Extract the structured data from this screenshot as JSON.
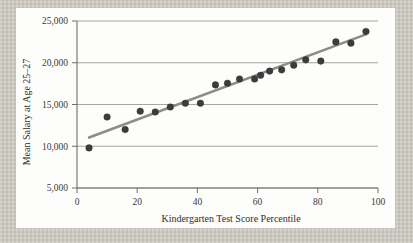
{
  "figure": {
    "background_color": "#cbc7be",
    "card_color": "#fdfdfb",
    "marker_color": "#3c3c3c",
    "trend_color": "#8c8c88",
    "grid_color": "#8e8e8a"
  },
  "chart_data": {
    "type": "scatter",
    "title": "",
    "xlabel": "Kindergarten Test Score Percentile",
    "ylabel": "Mean Salary at Age 25–27",
    "xlim": [
      0,
      100
    ],
    "ylim": [
      5000,
      25000
    ],
    "xticks": [
      0,
      20,
      40,
      60,
      80,
      100
    ],
    "xtick_labels": [
      "0",
      "20",
      "40",
      "60",
      "80",
      "100"
    ],
    "yticks": [
      5000,
      10000,
      15000,
      20000,
      25000
    ],
    "ytick_labels": [
      "5,000",
      "10,000",
      "15,000",
      "20,000",
      "25,000"
    ],
    "grid": "horizontal",
    "legend": "none",
    "series": [
      {
        "name": "Mean salary by kindergarten percentile",
        "marker": "filled-circle",
        "points": [
          {
            "x": 4,
            "y": 9800
          },
          {
            "x": 10,
            "y": 13500
          },
          {
            "x": 16,
            "y": 12000
          },
          {
            "x": 21,
            "y": 14200
          },
          {
            "x": 26,
            "y": 14100
          },
          {
            "x": 31,
            "y": 14700
          },
          {
            "x": 36,
            "y": 15150
          },
          {
            "x": 41,
            "y": 15150
          },
          {
            "x": 46,
            "y": 17350
          },
          {
            "x": 50,
            "y": 17550
          },
          {
            "x": 54,
            "y": 18050
          },
          {
            "x": 59,
            "y": 18050
          },
          {
            "x": 61,
            "y": 18500
          },
          {
            "x": 64,
            "y": 19000
          },
          {
            "x": 68,
            "y": 19150
          },
          {
            "x": 72,
            "y": 19700
          },
          {
            "x": 76,
            "y": 20350
          },
          {
            "x": 81,
            "y": 20200
          },
          {
            "x": 86,
            "y": 22500
          },
          {
            "x": 91,
            "y": 22350
          },
          {
            "x": 96,
            "y": 23750
          }
        ]
      }
    ],
    "trend_line": {
      "name": "fitted regression line",
      "x_start": 4,
      "y_start": 11050,
      "x_end": 96,
      "y_end": 23400
    }
  }
}
